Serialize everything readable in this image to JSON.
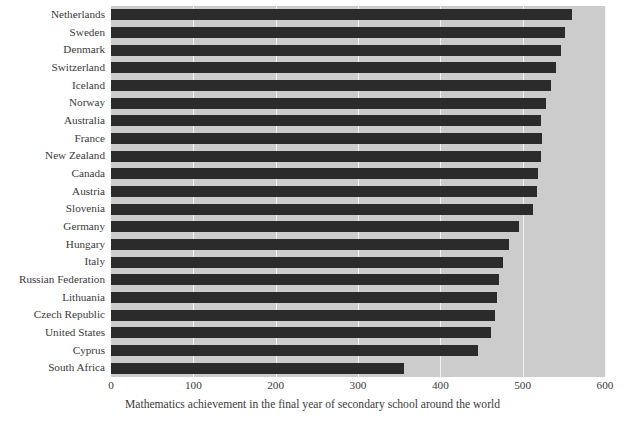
{
  "chart_data": {
    "type": "bar",
    "orientation": "horizontal",
    "title": "",
    "xlabel": "Mathematics achievement in the final year of secondary school around the world",
    "ylabel": "",
    "xlim": [
      0,
      600
    ],
    "xticks": [
      0,
      100,
      200,
      300,
      400,
      500,
      600
    ],
    "xtick_labels": [
      "0",
      "100",
      "200",
      "300",
      "400",
      "500",
      "600"
    ],
    "grid": true,
    "grid_axis": "x",
    "legend": "none",
    "categories": [
      "Netherlands",
      "Sweden",
      "Denmark",
      "Switzerland",
      "Iceland",
      "Norway",
      "Australia",
      "France",
      "New Zealand",
      "Canada",
      "Austria",
      "Slovenia",
      "Germany",
      "Hungary",
      "Italy",
      "Russian Federation",
      "Lithuania",
      "Czech Republic",
      "United States",
      "Cyprus",
      "South Africa"
    ],
    "values": [
      560,
      552,
      547,
      540,
      534,
      528,
      522,
      523,
      522,
      519,
      518,
      512,
      495,
      483,
      476,
      471,
      469,
      466,
      461,
      446,
      356
    ]
  },
  "colors": {
    "bar": "#2b2b2b",
    "panel_background": "#cccccc",
    "gridline": "#f2f2f2",
    "text": "#3a3a3a",
    "figure_background": "#ffffff"
  },
  "caption": {
    "text": "Mathematics achievement in the final year of secondary school around the world"
  }
}
